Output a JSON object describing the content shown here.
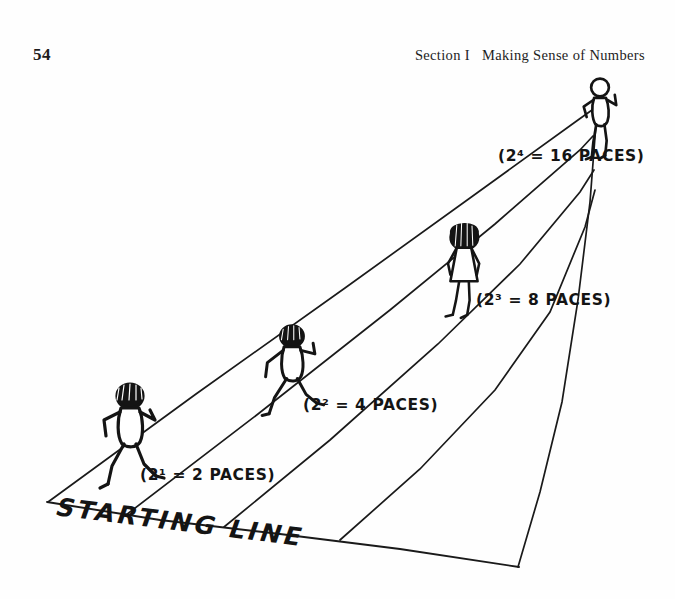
{
  "page": {
    "folio": "54",
    "running_head": "Section I   Making Sense of Numbers",
    "background_color": "#fefefe",
    "ink_color": "#141414"
  },
  "figure": {
    "name": "doubling-paces-perspective-diagram",
    "baseline_label": "STARTING LINE",
    "vanishing_point": {
      "x": 596,
      "y": 22
    },
    "lane_lines": [
      {
        "name": "lane-edge-left",
        "x_at_baseline": 48,
        "y_at_baseline": 430
      },
      {
        "name": "lane-line-2",
        "x_at_baseline": 126,
        "y_at_baseline": 443
      },
      {
        "name": "lane-line-3",
        "x_at_baseline": 224,
        "y_at_baseline": 455
      },
      {
        "name": "lane-line-4",
        "x_at_baseline": 340,
        "y_at_baseline": 468
      },
      {
        "name": "lane-edge-right",
        "x_at_baseline": 518,
        "y_at_baseline": 495
      }
    ],
    "runners": [
      {
        "id": "runner-1",
        "label": "(2¹ = 2 PACES)",
        "base": "2",
        "exponent": "1",
        "paces": "2",
        "pose": "running-away-arms-bent",
        "x": 130,
        "y": 368
      },
      {
        "id": "runner-2",
        "label": "(2² = 4 PACES)",
        "base": "2",
        "exponent": "2",
        "paces": "4",
        "pose": "running-away-arms-bent",
        "x": 292,
        "y": 303
      },
      {
        "id": "runner-3",
        "label": "(2³ = 8 PACES)",
        "base": "2",
        "exponent": "3",
        "paces": "8",
        "pose": "walking-away-skirt",
        "x": 464,
        "y": 198
      },
      {
        "id": "runner-4",
        "label": "(2⁴ = 16 PACES)",
        "base": "2",
        "exponent": "4",
        "paces": "16",
        "pose": "walking-away-arms-bent",
        "x": 598,
        "y": 48
      }
    ]
  }
}
